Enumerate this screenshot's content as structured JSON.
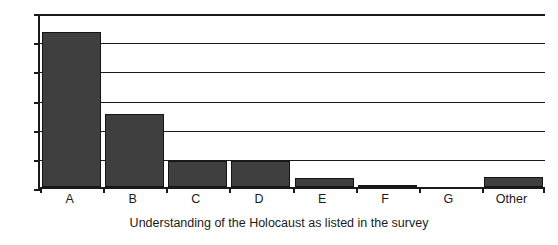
{
  "chart_data": {
    "type": "bar",
    "title": "",
    "subtitle": "",
    "xlabel": "Understanding of the Holocaust as listed in the survey",
    "ylabel": "",
    "categories": [
      "A",
      "B",
      "C",
      "D",
      "E",
      "F",
      "G",
      "Other"
    ],
    "values": [
      53,
      25,
      9,
      9,
      3,
      0.7,
      0,
      3.5
    ],
    "ylim": [
      0,
      60
    ],
    "yticks": [
      0,
      10,
      20,
      30,
      40,
      50,
      60
    ],
    "ytick_labels": [
      "0",
      "10",
      "20",
      "30",
      "40",
      "50",
      "60"
    ],
    "grid": true,
    "grid_axis": "y",
    "legend": false,
    "legend_position": "none",
    "bar_color": "#3f3f3f",
    "bar_edge_color": "#151515",
    "axis_color": "#1a1a1a",
    "background_color": "#ffffff"
  }
}
